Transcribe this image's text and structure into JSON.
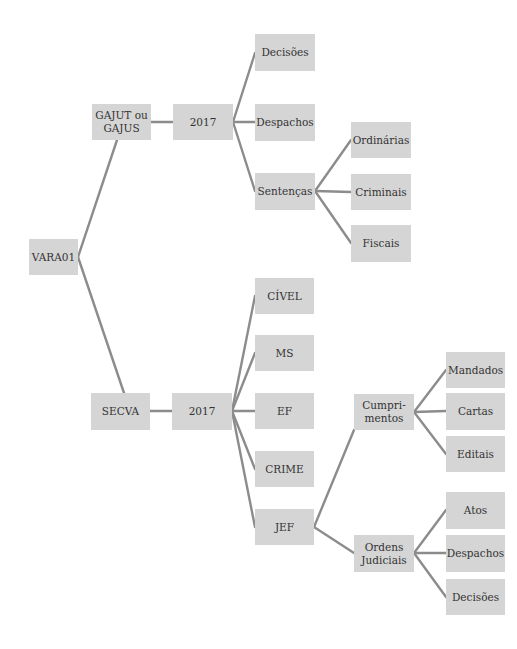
{
  "colors": {
    "node_fill": "#d5d5d5",
    "edge": "#8c8c8c",
    "text": "#333333",
    "background": "#ffffff"
  },
  "nodes": [
    {
      "id": "vara01",
      "label": "VARA01",
      "x": 29,
      "y": 239,
      "w": 49,
      "h": 36
    },
    {
      "id": "gajut",
      "label": "GAJUT ou\nGAJUS",
      "x": 92,
      "y": 104,
      "w": 59,
      "h": 36
    },
    {
      "id": "gajut-2017",
      "label": "2017",
      "x": 173,
      "y": 104,
      "w": 60,
      "h": 36
    },
    {
      "id": "gajut-decisoes",
      "label": "Decisões",
      "x": 255,
      "y": 34,
      "w": 60,
      "h": 37
    },
    {
      "id": "gajut-despachos",
      "label": "Despachos",
      "x": 255,
      "y": 104,
      "w": 60,
      "h": 37
    },
    {
      "id": "sentencas",
      "label": "Sentenças",
      "x": 255,
      "y": 173,
      "w": 60,
      "h": 37
    },
    {
      "id": "ordinarias",
      "label": "Ordinárias",
      "x": 351,
      "y": 122,
      "w": 60,
      "h": 36
    },
    {
      "id": "criminais",
      "label": "Criminais",
      "x": 351,
      "y": 174,
      "w": 60,
      "h": 36
    },
    {
      "id": "fiscais",
      "label": "Fiscais",
      "x": 351,
      "y": 225,
      "w": 60,
      "h": 37
    },
    {
      "id": "secva",
      "label": "SECVA",
      "x": 91,
      "y": 393,
      "w": 59,
      "h": 37
    },
    {
      "id": "secva-2017",
      "label": "2017",
      "x": 172,
      "y": 393,
      "w": 60,
      "h": 37
    },
    {
      "id": "civel",
      "label": "CÍVEL",
      "x": 255,
      "y": 278,
      "w": 59,
      "h": 36
    },
    {
      "id": "ms",
      "label": "MS",
      "x": 255,
      "y": 335,
      "w": 59,
      "h": 36
    },
    {
      "id": "ef",
      "label": "EF",
      "x": 255,
      "y": 393,
      "w": 59,
      "h": 36
    },
    {
      "id": "crime",
      "label": "CRIME",
      "x": 255,
      "y": 451,
      "w": 59,
      "h": 36
    },
    {
      "id": "jef",
      "label": "JEF",
      "x": 255,
      "y": 509,
      "w": 59,
      "h": 36
    },
    {
      "id": "cumprimentos",
      "label": "Cumpri-\nmentos",
      "x": 354,
      "y": 394,
      "w": 60,
      "h": 36
    },
    {
      "id": "ordens-judiciais",
      "label": "Ordens\nJudiciais",
      "x": 354,
      "y": 535,
      "w": 60,
      "h": 37
    },
    {
      "id": "mandados",
      "label": "Mandados",
      "x": 446,
      "y": 352,
      "w": 59,
      "h": 36
    },
    {
      "id": "cartas",
      "label": "Cartas",
      "x": 446,
      "y": 393,
      "w": 59,
      "h": 37
    },
    {
      "id": "editais",
      "label": "Editais",
      "x": 446,
      "y": 436,
      "w": 59,
      "h": 36
    },
    {
      "id": "atos",
      "label": "Atos",
      "x": 446,
      "y": 492,
      "w": 59,
      "h": 37
    },
    {
      "id": "oj-despachos",
      "label": "Despachos",
      "x": 446,
      "y": 535,
      "w": 59,
      "h": 37
    },
    {
      "id": "oj-decisoes",
      "label": "Decisões",
      "x": 446,
      "y": 579,
      "w": 59,
      "h": 36
    }
  ],
  "edges": [
    {
      "from": "vara01",
      "to": "gajut",
      "x1": 78,
      "y1": 257,
      "x2": 117,
      "y2": 140
    },
    {
      "from": "vara01",
      "to": "secva",
      "x1": 78,
      "y1": 257,
      "x2": 124,
      "y2": 393
    },
    {
      "from": "gajut",
      "to": "gajut-2017",
      "x1": 151,
      "y1": 122,
      "x2": 173,
      "y2": 122
    },
    {
      "from": "gajut-2017",
      "to": "gajut-decisoes",
      "x1": 233,
      "y1": 122,
      "x2": 255,
      "y2": 53
    },
    {
      "from": "gajut-2017",
      "to": "gajut-despachos",
      "x1": 233,
      "y1": 122,
      "x2": 255,
      "y2": 122
    },
    {
      "from": "gajut-2017",
      "to": "sentencas",
      "x1": 233,
      "y1": 122,
      "x2": 255,
      "y2": 191
    },
    {
      "from": "sentencas",
      "to": "ordinarias",
      "x1": 315,
      "y1": 191,
      "x2": 351,
      "y2": 140
    },
    {
      "from": "sentencas",
      "to": "criminais",
      "x1": 315,
      "y1": 191,
      "x2": 351,
      "y2": 192
    },
    {
      "from": "sentencas",
      "to": "fiscais",
      "x1": 315,
      "y1": 191,
      "x2": 351,
      "y2": 243
    },
    {
      "from": "secva",
      "to": "secva-2017",
      "x1": 150,
      "y1": 411,
      "x2": 172,
      "y2": 411
    },
    {
      "from": "secva-2017",
      "to": "civel",
      "x1": 232,
      "y1": 411,
      "x2": 255,
      "y2": 296
    },
    {
      "from": "secva-2017",
      "to": "ms",
      "x1": 232,
      "y1": 411,
      "x2": 255,
      "y2": 353
    },
    {
      "from": "secva-2017",
      "to": "ef",
      "x1": 232,
      "y1": 411,
      "x2": 255,
      "y2": 411
    },
    {
      "from": "secva-2017",
      "to": "crime",
      "x1": 232,
      "y1": 411,
      "x2": 255,
      "y2": 469
    },
    {
      "from": "secva-2017",
      "to": "jef",
      "x1": 232,
      "y1": 411,
      "x2": 255,
      "y2": 527
    },
    {
      "from": "jef",
      "to": "cumprimentos",
      "x1": 314,
      "y1": 527,
      "x2": 354,
      "y2": 430
    },
    {
      "from": "jef",
      "to": "ordens-judiciais",
      "x1": 314,
      "y1": 527,
      "x2": 354,
      "y2": 553
    },
    {
      "from": "cumprimentos",
      "to": "mandados",
      "x1": 414,
      "y1": 412,
      "x2": 446,
      "y2": 370
    },
    {
      "from": "cumprimentos",
      "to": "cartas",
      "x1": 414,
      "y1": 412,
      "x2": 446,
      "y2": 411
    },
    {
      "from": "cumprimentos",
      "to": "editais",
      "x1": 414,
      "y1": 412,
      "x2": 446,
      "y2": 454
    },
    {
      "from": "ordens-judiciais",
      "to": "atos",
      "x1": 414,
      "y1": 553,
      "x2": 446,
      "y2": 510
    },
    {
      "from": "ordens-judiciais",
      "to": "oj-despachos",
      "x1": 414,
      "y1": 553,
      "x2": 446,
      "y2": 553
    },
    {
      "from": "ordens-judiciais",
      "to": "oj-decisoes",
      "x1": 414,
      "y1": 553,
      "x2": 446,
      "y2": 597
    }
  ]
}
